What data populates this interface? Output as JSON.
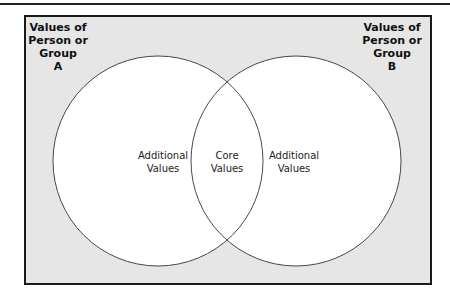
{
  "diagram": {
    "type": "venn",
    "sets": [
      {
        "id": "A",
        "title": [
          "Values of",
          "Person or",
          "Group",
          "A"
        ],
        "region_label": [
          "Additional",
          "Values"
        ]
      },
      {
        "id": "B",
        "title": [
          "Values of",
          "Person or",
          "Group",
          "B"
        ],
        "region_label": [
          "Additional",
          "Values"
        ]
      }
    ],
    "intersection": {
      "label": [
        "Core",
        "Values"
      ]
    },
    "colors": {
      "background": "#e6e6e6",
      "circle_fill": "#ffffff",
      "stroke": "#333333",
      "frame_border": "#1a1a1a"
    }
  }
}
